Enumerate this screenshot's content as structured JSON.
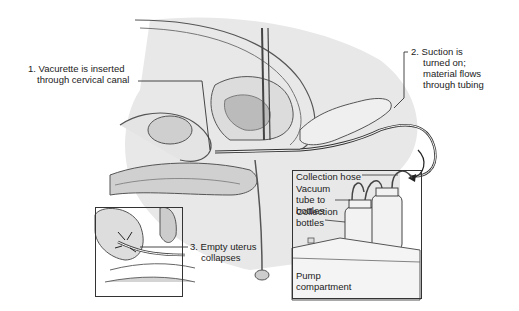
{
  "diagram": {
    "steps": [
      {
        "number": "1.",
        "line1": "Vacurette is inserted",
        "line2": "through cervical canal"
      },
      {
        "number": "2.",
        "line1": "Suction is",
        "line2": "turned on;",
        "line3": "material flows",
        "line4": "through tubing"
      },
      {
        "number": "3.",
        "line1": "Empty uterus",
        "line2": "collapses"
      }
    ],
    "equipment_labels": {
      "collection_hose": "Collection hose",
      "vacuum_tube_1": "Vacuum",
      "vacuum_tube_2": "tube to",
      "vacuum_tube_3": "bottles",
      "collection_bottles_1": "Collection",
      "collection_bottles_2": "bottles",
      "pump_1": "Pump",
      "pump_2": "compartment"
    }
  }
}
